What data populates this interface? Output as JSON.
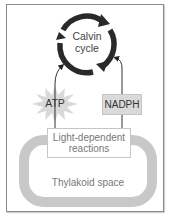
{
  "diagram": {
    "calvin_cycle": {
      "line1": "Calvin",
      "line2": "cycle"
    },
    "atp": {
      "label": "ATP"
    },
    "nadph": {
      "label": "NADPH"
    },
    "light_reactions": {
      "line1": "Light-dependent",
      "line2": "reactions"
    },
    "thylakoid": {
      "label": "Thylakoid space"
    },
    "colors": {
      "cycle_arrow": "#2a2a2a",
      "thylakoid_membrane": "#c8c8c8",
      "nadph_fill": "#dadada",
      "atp_fill": "#d9d9d9",
      "frame_border": "#8a8a8a"
    }
  }
}
